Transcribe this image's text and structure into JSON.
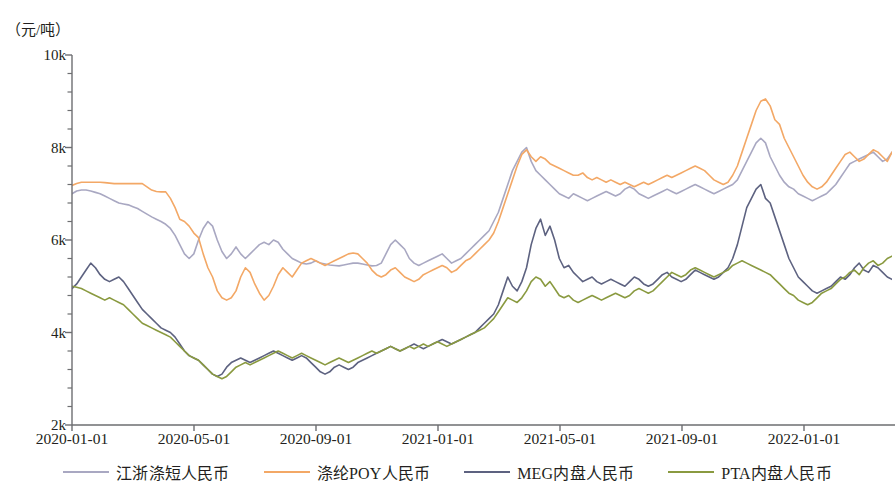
{
  "chart_data": {
    "type": "line",
    "title": "",
    "subtitle": "",
    "xlabel": "",
    "ylabel": "（元/吨）",
    "unit_label": "（元/吨）",
    "grid": false,
    "legend_position": "bottom",
    "xlim": [
      "2020-01-01",
      "2022-02-20"
    ],
    "ylim": [
      2000,
      10000
    ],
    "y_ticks": [
      "2k",
      "4k",
      "6k",
      "8k",
      "10k"
    ],
    "y_tick_values": [
      2000,
      4000,
      6000,
      8000,
      10000
    ],
    "y_minor_tick_count": 4,
    "x_ticks": [
      "2020-01-01",
      "2020-05-01",
      "2020-09-01",
      "2021-01-01",
      "2021-05-01",
      "2021-09-01",
      "2022-01-01"
    ],
    "colors": {
      "jiangzhe": "#a9a8c2",
      "poy": "#f3a866",
      "meg": "#5d6280",
      "pta": "#8a9a40"
    },
    "series": [
      {
        "name": "江浙涤短人民币",
        "color": "#a9a8c2",
        "values": [
          7000,
          7060,
          7080,
          7080,
          7060,
          7030,
          7000,
          6950,
          6900,
          6850,
          6800,
          6780,
          6760,
          6720,
          6680,
          6620,
          6560,
          6500,
          6450,
          6400,
          6340,
          6250,
          6100,
          5900,
          5700,
          5600,
          5700,
          6000,
          6250,
          6400,
          6300,
          6000,
          5750,
          5600,
          5700,
          5850,
          5700,
          5600,
          5700,
          5800,
          5900,
          5950,
          5900,
          6000,
          5950,
          5800,
          5700,
          5600,
          5550,
          5500,
          5480,
          5500,
          5550,
          5500,
          5480,
          5460,
          5450,
          5440,
          5460,
          5480,
          5500,
          5500,
          5480,
          5460,
          5440,
          5450,
          5500,
          5700,
          5900,
          6000,
          5900,
          5800,
          5600,
          5500,
          5450,
          5500,
          5550,
          5600,
          5650,
          5700,
          5600,
          5500,
          5550,
          5600,
          5700,
          5800,
          5900,
          6000,
          6100,
          6200,
          6400,
          6600,
          6900,
          7200,
          7500,
          7700,
          7900,
          8000,
          7700,
          7500,
          7400,
          7300,
          7200,
          7100,
          7000,
          6950,
          6900,
          7000,
          6950,
          6900,
          6850,
          6900,
          6950,
          7000,
          7050,
          7000,
          6950,
          7000,
          7100,
          7150,
          7100,
          7000,
          6950,
          6900,
          6950,
          7000,
          7050,
          7100,
          7050,
          7000,
          7050,
          7100,
          7150,
          7200,
          7150,
          7100,
          7050,
          7000,
          7050,
          7100,
          7150,
          7200,
          7300,
          7500,
          7700,
          7900,
          8100,
          8200,
          8100,
          7800,
          7600,
          7400,
          7250,
          7150,
          7100,
          7000,
          6950,
          6900,
          6850,
          6900,
          6950,
          7000,
          7100,
          7200,
          7350,
          7500,
          7650,
          7700,
          7750,
          7800,
          7850,
          7900,
          7800,
          7700,
          7750,
          7900
        ]
      },
      {
        "name": "涤纶POY人民币",
        "color": "#f3a866",
        "values": [
          7180,
          7220,
          7250,
          7250,
          7250,
          7250,
          7250,
          7240,
          7230,
          7220,
          7220,
          7220,
          7220,
          7220,
          7220,
          7220,
          7150,
          7080,
          7050,
          7040,
          7040,
          6900,
          6700,
          6450,
          6400,
          6300,
          6150,
          6050,
          5700,
          5400,
          5200,
          4900,
          4750,
          4700,
          4750,
          4900,
          5200,
          5400,
          5300,
          5050,
          4850,
          4700,
          4800,
          5000,
          5250,
          5400,
          5300,
          5200,
          5350,
          5500,
          5550,
          5600,
          5550,
          5500,
          5450,
          5500,
          5550,
          5600,
          5650,
          5700,
          5720,
          5700,
          5600,
          5500,
          5350,
          5250,
          5200,
          5250,
          5350,
          5400,
          5300,
          5200,
          5150,
          5100,
          5150,
          5250,
          5300,
          5350,
          5400,
          5450,
          5400,
          5300,
          5350,
          5450,
          5550,
          5600,
          5700,
          5800,
          5900,
          6000,
          6150,
          6400,
          6700,
          7000,
          7300,
          7600,
          7850,
          7950,
          7800,
          7700,
          7800,
          7750,
          7650,
          7600,
          7550,
          7500,
          7450,
          7400,
          7400,
          7450,
          7350,
          7300,
          7350,
          7300,
          7250,
          7300,
          7250,
          7200,
          7250,
          7200,
          7150,
          7200,
          7250,
          7200,
          7250,
          7300,
          7350,
          7400,
          7350,
          7400,
          7450,
          7500,
          7550,
          7600,
          7550,
          7500,
          7400,
          7300,
          7250,
          7200,
          7250,
          7400,
          7600,
          7900,
          8200,
          8500,
          8800,
          9000,
          9050,
          8900,
          8600,
          8500,
          8200,
          8000,
          7800,
          7600,
          7400,
          7250,
          7150,
          7100,
          7150,
          7250,
          7400,
          7550,
          7700,
          7850,
          7900,
          7800,
          7700,
          7750,
          7850,
          7950,
          7900,
          7800,
          7700,
          7900
        ]
      },
      {
        "name": "MEG内盘人民币",
        "color": "#5d6280",
        "values": [
          4950,
          5050,
          5200,
          5350,
          5500,
          5400,
          5250,
          5150,
          5100,
          5150,
          5200,
          5100,
          4950,
          4800,
          4650,
          4500,
          4400,
          4300,
          4200,
          4100,
          4050,
          4000,
          3900,
          3750,
          3600,
          3500,
          3450,
          3400,
          3300,
          3200,
          3100,
          3050,
          3100,
          3250,
          3350,
          3400,
          3450,
          3400,
          3350,
          3400,
          3450,
          3500,
          3550,
          3600,
          3550,
          3500,
          3450,
          3400,
          3450,
          3500,
          3450,
          3350,
          3250,
          3150,
          3100,
          3150,
          3250,
          3300,
          3250,
          3200,
          3250,
          3350,
          3400,
          3450,
          3500,
          3550,
          3600,
          3650,
          3700,
          3650,
          3600,
          3650,
          3700,
          3750,
          3700,
          3650,
          3700,
          3750,
          3800,
          3850,
          3800,
          3750,
          3800,
          3850,
          3900,
          3950,
          4000,
          4100,
          4200,
          4300,
          4400,
          4600,
          4900,
          5200,
          5000,
          4900,
          5100,
          5400,
          5900,
          6250,
          6450,
          6100,
          6300,
          6000,
          5600,
          5400,
          5450,
          5300,
          5200,
          5100,
          5150,
          5200,
          5100,
          5050,
          5100,
          5150,
          5100,
          5050,
          5000,
          5100,
          5200,
          5150,
          5050,
          5000,
          5050,
          5150,
          5250,
          5300,
          5200,
          5150,
          5100,
          5150,
          5250,
          5350,
          5300,
          5250,
          5200,
          5150,
          5200,
          5300,
          5400,
          5600,
          5900,
          6300,
          6700,
          6900,
          7100,
          7200,
          6900,
          6800,
          6500,
          6200,
          5900,
          5600,
          5400,
          5200,
          5100,
          5000,
          4900,
          4850,
          4900,
          4950,
          5000,
          5100,
          5200,
          5150,
          5250,
          5400,
          5500,
          5350,
          5300,
          5450,
          5400,
          5300,
          5200,
          5150
        ]
      },
      {
        "name": "PTA内盘人民币",
        "color": "#8a9a40",
        "values": [
          5000,
          4980,
          4950,
          4900,
          4850,
          4800,
          4750,
          4700,
          4750,
          4700,
          4650,
          4600,
          4500,
          4400,
          4300,
          4200,
          4150,
          4100,
          4050,
          4000,
          3950,
          3900,
          3800,
          3700,
          3600,
          3500,
          3450,
          3400,
          3300,
          3200,
          3100,
          3050,
          3000,
          3050,
          3150,
          3250,
          3300,
          3350,
          3300,
          3350,
          3400,
          3450,
          3500,
          3550,
          3600,
          3550,
          3500,
          3450,
          3500,
          3550,
          3500,
          3450,
          3400,
          3350,
          3300,
          3350,
          3400,
          3450,
          3400,
          3350,
          3400,
          3450,
          3500,
          3550,
          3600,
          3550,
          3600,
          3650,
          3700,
          3650,
          3600,
          3650,
          3700,
          3650,
          3700,
          3750,
          3700,
          3750,
          3800,
          3750,
          3700,
          3750,
          3800,
          3850,
          3900,
          3950,
          4000,
          4050,
          4100,
          4200,
          4300,
          4450,
          4600,
          4750,
          4700,
          4650,
          4750,
          4900,
          5100,
          5200,
          5150,
          5000,
          5100,
          4950,
          4800,
          4750,
          4800,
          4700,
          4650,
          4700,
          4750,
          4800,
          4750,
          4700,
          4750,
          4800,
          4850,
          4800,
          4750,
          4800,
          4900,
          4950,
          4900,
          4850,
          4900,
          5000,
          5100,
          5200,
          5300,
          5250,
          5200,
          5250,
          5350,
          5400,
          5350,
          5300,
          5250,
          5200,
          5250,
          5300,
          5350,
          5450,
          5500,
          5550,
          5500,
          5450,
          5400,
          5350,
          5300,
          5250,
          5150,
          5050,
          4950,
          4850,
          4800,
          4700,
          4650,
          4600,
          4650,
          4750,
          4850,
          4900,
          4950,
          5050,
          5150,
          5200,
          5300,
          5350,
          5250,
          5400,
          5500,
          5550,
          5450,
          5500,
          5600,
          5650
        ]
      }
    ]
  },
  "legend": {
    "items": [
      {
        "label": "江浙涤短人民币",
        "color": "#a9a8c2"
      },
      {
        "label": "涤纶POY人民币",
        "color": "#f3a866"
      },
      {
        "label": "MEG内盘人民币",
        "color": "#5d6280"
      },
      {
        "label": "PTA内盘人民币",
        "color": "#8a9a40"
      }
    ]
  }
}
